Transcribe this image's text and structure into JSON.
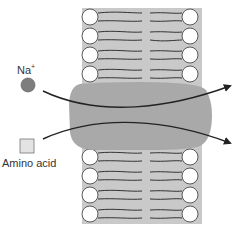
{
  "diagram": {
    "labels": {
      "sodium_ion": "Na",
      "sodium_charge": "+",
      "amino_acid": "Amino acid"
    },
    "colors": {
      "membrane_band": "#c9c9c9",
      "protein": "#a9a9a9",
      "sodium_ion": "#7e7e7e",
      "amino_acid": "#e3e3e3",
      "lipid_head": "#ffffff",
      "lipid_tail": "#333333",
      "arrow": "#222222"
    },
    "lipid_rows_top": [
      17,
      36,
      55,
      74
    ],
    "lipid_rows_bottom": [
      157,
      176,
      195,
      214
    ]
  }
}
